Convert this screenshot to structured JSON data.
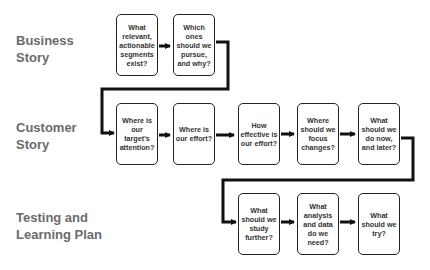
{
  "rows": [
    {
      "label": "Business Story",
      "label_lines": [
        "Business",
        "Story"
      ],
      "steps": [
        "What relevant, actionable segments exist?",
        "Which ones should we pursue, and why?"
      ]
    },
    {
      "label": "Customer Story",
      "label_lines": [
        "Customer",
        "Story"
      ],
      "steps": [
        "Where is our target's attention?",
        "Where is our effort?",
        "How effective is our effort?",
        "Where should we focus changes?",
        "What should we do now, and later?"
      ]
    },
    {
      "label": "Testing and Learning Plan",
      "label_lines": [
        "Testing and",
        "Learning Plan"
      ],
      "steps": [
        "What should we study further?",
        "What analysis and data do we need?",
        "What should we try?"
      ]
    }
  ],
  "colors": {
    "label": "#6b6b6b",
    "box_border": "#222222",
    "arrow": "#111111",
    "text": "#333333"
  }
}
